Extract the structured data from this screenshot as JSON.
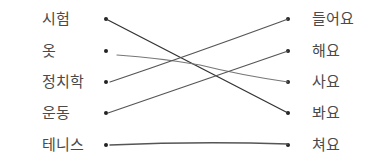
{
  "exercise": {
    "left_items": [
      {
        "label": "시험",
        "y": 19
      },
      {
        "label": "옷",
        "y": 51
      },
      {
        "label": "정치학",
        "y": 82
      },
      {
        "label": "운동",
        "y": 113
      },
      {
        "label": "테니스",
        "y": 145
      }
    ],
    "right_items": [
      {
        "label": "들어요",
        "y": 19
      },
      {
        "label": "해요",
        "y": 51
      },
      {
        "label": "사요",
        "y": 82
      },
      {
        "label": "봐요",
        "y": 113
      },
      {
        "label": "쳐요",
        "y": 145
      }
    ],
    "matches": [
      {
        "left": "시험",
        "right": "봐요"
      },
      {
        "left": "옷",
        "right": "사요"
      },
      {
        "left": "정치학",
        "right": "들어요"
      },
      {
        "left": "운동",
        "right": "해요"
      },
      {
        "left": "테니스",
        "right": "쳐요"
      }
    ],
    "line_color": "#555555",
    "dot_color": "#222222"
  }
}
